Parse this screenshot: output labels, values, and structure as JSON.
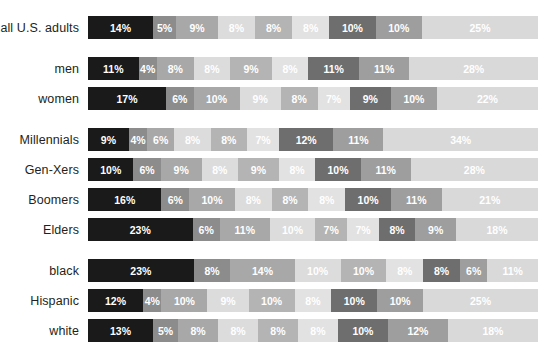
{
  "chart_data": {
    "type": "bar",
    "subtype": "horizontal-stacked-100",
    "title": "",
    "xlabel": "",
    "ylabel": "",
    "xlim": [
      0,
      100
    ],
    "grid": false,
    "legend": "none",
    "value_suffix": "%",
    "categories": [
      "all U.S. adults",
      "men",
      "women",
      "Millennials",
      "Gen-Xers",
      "Boomers",
      "Elders",
      "black",
      "Hispanic",
      "white"
    ],
    "group_breaks": [
      1,
      3,
      7
    ],
    "segment_colors": [
      "#1a1a1a",
      "#8c8c8c",
      "#a8a8a8",
      "#dcdcdc",
      "#b4b4b4",
      "#e2e2e2",
      "#6e6e6e",
      "#9e9e9e",
      "#d9d9d9"
    ],
    "rows": [
      {
        "label": "all U.S. adults",
        "values": [
          14,
          5,
          9,
          8,
          8,
          8,
          10,
          10,
          25
        ],
        "labels": [
          "14%",
          "5%",
          "9%",
          "8%",
          "8%",
          "8%",
          "10%",
          "10%",
          "25%"
        ]
      },
      {
        "label": "men",
        "values": [
          11,
          4,
          8,
          8,
          9,
          8,
          11,
          11,
          28
        ],
        "labels": [
          "11%",
          "4%",
          "8%",
          "8%",
          "9%",
          "8%",
          "11%",
          "11%",
          "28%"
        ]
      },
      {
        "label": "women",
        "values": [
          17,
          6,
          10,
          9,
          8,
          7,
          9,
          10,
          22
        ],
        "labels": [
          "17%",
          "6%",
          "10%",
          "9%",
          "8%",
          "7%",
          "9%",
          "10%",
          "22%"
        ]
      },
      {
        "label": "Millennials",
        "values": [
          9,
          4,
          6,
          8,
          8,
          7,
          12,
          11,
          34
        ],
        "labels": [
          "9%",
          "4%",
          "6%",
          "8%",
          "8%",
          "7%",
          "12%",
          "11%",
          "34%"
        ]
      },
      {
        "label": "Gen-Xers",
        "values": [
          10,
          6,
          9,
          8,
          9,
          8,
          10,
          11,
          28
        ],
        "labels": [
          "10%",
          "6%",
          "9%",
          "8%",
          "9%",
          "8%",
          "10%",
          "11%",
          "28%"
        ]
      },
      {
        "label": "Boomers",
        "values": [
          16,
          6,
          10,
          8,
          8,
          8,
          10,
          11,
          21
        ],
        "labels": [
          "16%",
          "6%",
          "10%",
          "8%",
          "8%",
          "8%",
          "10%",
          "11%",
          "21%"
        ]
      },
      {
        "label": "Elders",
        "values": [
          23,
          6,
          11,
          10,
          7,
          7,
          8,
          9,
          18
        ],
        "labels": [
          "23%",
          "6%",
          "11%",
          "10%",
          "7%",
          "7%",
          "8%",
          "9%",
          "18%"
        ]
      },
      {
        "label": "black",
        "values": [
          23,
          8,
          14,
          10,
          10,
          8,
          8,
          6,
          11
        ],
        "labels": [
          "23%",
          "8%",
          "14%",
          "10%",
          "10%",
          "8%",
          "8%",
          "6%",
          "11%"
        ]
      },
      {
        "label": "Hispanic",
        "values": [
          12,
          4,
          10,
          9,
          10,
          8,
          10,
          10,
          25
        ],
        "labels": [
          "12%",
          "4%",
          "10%",
          "9%",
          "10%",
          "8%",
          "10%",
          "10%",
          "25%"
        ]
      },
      {
        "label": "white",
        "values": [
          13,
          5,
          8,
          8,
          8,
          8,
          10,
          12,
          18
        ],
        "labels": [
          "13%",
          "5%",
          "8%",
          "8%",
          "8%",
          "8%",
          "10%",
          "12%",
          "18%"
        ]
      }
    ]
  }
}
